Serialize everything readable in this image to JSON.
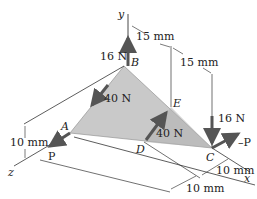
{
  "figure": {
    "type": "3D statics free-body diagram",
    "plate_color": "#c9c9c9",
    "arrow_color": "#555555",
    "line_color": "#333333"
  },
  "axes": {
    "x": "x",
    "y": "y",
    "z": "z"
  },
  "points": {
    "A": "A",
    "B": "B",
    "C": "C",
    "D": "D",
    "E": "E"
  },
  "forces": {
    "B_up": "16 N",
    "AB_load": "40 N",
    "DE_load": "40 N",
    "C_down": "16 N",
    "A_P": "P",
    "C_negP": "–P"
  },
  "dimensions": {
    "top_15_left": "15 mm",
    "top_15_right": "15 mm",
    "left_10": "10 mm",
    "bottom_10_right": "10 mm",
    "bottom_10_left": "10 mm"
  }
}
